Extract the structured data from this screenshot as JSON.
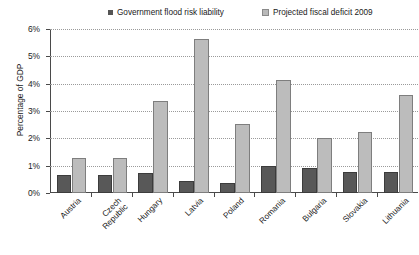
{
  "chart_data": {
    "type": "bar",
    "title": "",
    "subtitle": "",
    "xlabel": "",
    "ylabel": "Percentage of GDP",
    "ylim": [
      0,
      6
    ],
    "ytick_labels": [
      "0%",
      "1%",
      "2%",
      "3%",
      "4%",
      "5%",
      "6%"
    ],
    "ytick_values": [
      0,
      1,
      2,
      3,
      4,
      5,
      6
    ],
    "grid": true,
    "grid_style": "dotted horizontal",
    "legend_position": "top",
    "categories": [
      "Austria",
      "Czech Republic",
      "Hungary",
      "Latvia",
      "Poland",
      "Romania",
      "Bulgaria",
      "Slovakia",
      "Lithuania"
    ],
    "series": [
      {
        "name": "Government flood risk liability",
        "color": "#585858",
        "values": [
          0.6,
          0.6,
          0.65,
          0.35,
          0.3,
          0.9,
          0.85,
          0.7,
          0.7
        ]
      },
      {
        "name": "Projected fiscal deficit 2009",
        "color": "#bcbcbc",
        "values": [
          1.2,
          1.2,
          3.3,
          5.55,
          2.45,
          4.05,
          1.95,
          2.15,
          3.5
        ]
      }
    ]
  },
  "legend": {
    "items": [
      {
        "label": "Government flood risk liability",
        "swatch": "dark-square-marker"
      },
      {
        "label": "Projected fiscal deficit 2009",
        "swatch": "light-square-marker"
      }
    ]
  },
  "axes": {
    "y_title": "Percentage of GDP"
  }
}
